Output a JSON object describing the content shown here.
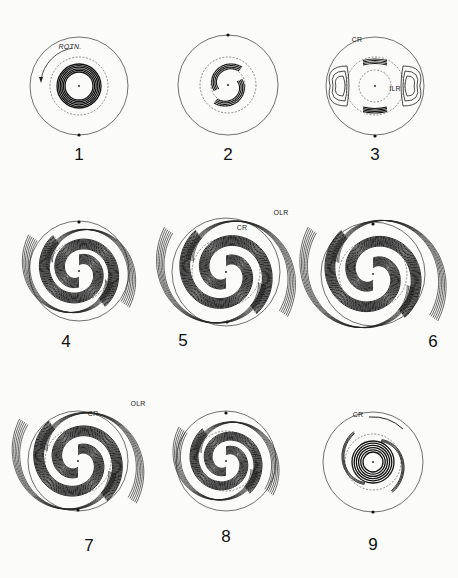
{
  "figure": {
    "panels": [
      {
        "id": 1,
        "label": "1",
        "cx": 79,
        "cy": 86,
        "r_outer": 49,
        "r_dash": 29,
        "r_inner": 0,
        "annotations": [
          {
            "text": "ROTN.",
            "x": 70,
            "y": 46,
            "italic": true
          }
        ],
        "kind": "rings",
        "arms": 0
      },
      {
        "id": 2,
        "label": "2",
        "cx": 228,
        "cy": 85,
        "r_outer": 50,
        "r_dash": 28,
        "r_inner": 17,
        "annotations": [],
        "kind": "rings",
        "arms": 2
      },
      {
        "id": 3,
        "label": "3",
        "cx": 375,
        "cy": 86,
        "r_outer": 49,
        "r_dash": 29,
        "r_inner": 16,
        "annotations": [
          {
            "text": "CR",
            "x": 357,
            "y": 39,
            "italic": false
          },
          {
            "text": "ILR",
            "x": 395,
            "y": 88,
            "italic": false
          }
        ],
        "kind": "bar",
        "arms": 2
      },
      {
        "id": 4,
        "label": "4",
        "cx": 79,
        "cy": 271,
        "r_outer": 50,
        "r_dash": 30,
        "r_inner": 0,
        "annotations": [],
        "kind": "spiral",
        "arms": 2,
        "extent": 62
      },
      {
        "id": 5,
        "label": "5",
        "cx": 226,
        "cy": 272,
        "r_outer": 54,
        "r_dash": 34,
        "r_inner": 0,
        "annotations": [
          {
            "text": "OLR",
            "x": 281,
            "y": 212,
            "italic": false
          },
          {
            "text": "CR",
            "x": 242,
            "y": 227,
            "italic": false
          }
        ],
        "kind": "spiral",
        "arms": 2,
        "extent": 76
      },
      {
        "id": 6,
        "label": "6",
        "cx": 373,
        "cy": 274,
        "r_outer": 52,
        "r_dash": 34,
        "r_inner": 0,
        "annotations": [],
        "kind": "spiral",
        "arms": 2,
        "extent": 80
      },
      {
        "id": 7,
        "label": "7",
        "cx": 78,
        "cy": 461,
        "r_outer": 50,
        "r_dash": 33,
        "r_inner": 0,
        "annotations": [
          {
            "text": "OLR",
            "x": 138,
            "y": 403,
            "italic": false
          },
          {
            "text": "CR",
            "x": 93,
            "y": 413,
            "italic": false
          }
        ],
        "kind": "spiral",
        "arms": 2,
        "extent": 72
      },
      {
        "id": 8,
        "label": "8",
        "cx": 226,
        "cy": 461,
        "r_outer": 50,
        "r_dash": 30,
        "r_inner": 0,
        "annotations": [],
        "kind": "spiral-late",
        "arms": 2,
        "extent": 58
      },
      {
        "id": 9,
        "label": "9",
        "cx": 373,
        "cy": 462,
        "r_outer": 50,
        "r_dash": 28,
        "r_inner": 0,
        "annotations": [
          {
            "text": "CR",
            "x": 358,
            "y": 414,
            "italic": false
          }
        ],
        "kind": "rings-late",
        "arms": 2
      }
    ],
    "legend_terms": [
      "ROTN.",
      "CR",
      "ILR",
      "OLR"
    ]
  }
}
